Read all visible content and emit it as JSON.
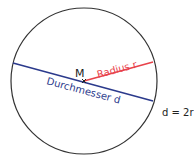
{
  "diagram": {
    "center_label": "M",
    "radius_label": "Radius r",
    "diameter_label": "Durchmesser d",
    "formula": "d = 2r",
    "colors": {
      "circle": "#333333",
      "radius": "#e8424a",
      "diameter": "#2b3a8c",
      "text": "#222222"
    }
  }
}
